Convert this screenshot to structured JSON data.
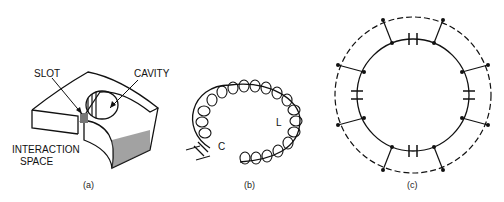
{
  "figure": {
    "panels": [
      {
        "id": "a",
        "caption": "(a)",
        "labels": {
          "slot": "SLOT",
          "cavity": "CAVITY",
          "interaction_line1": "INTERACTION",
          "interaction_line2": "SPACE"
        }
      },
      {
        "id": "b",
        "caption": "(b)",
        "labels": {
          "capacitor": "C",
          "inductor": "L"
        }
      },
      {
        "id": "c",
        "caption": "(c)"
      }
    ]
  }
}
